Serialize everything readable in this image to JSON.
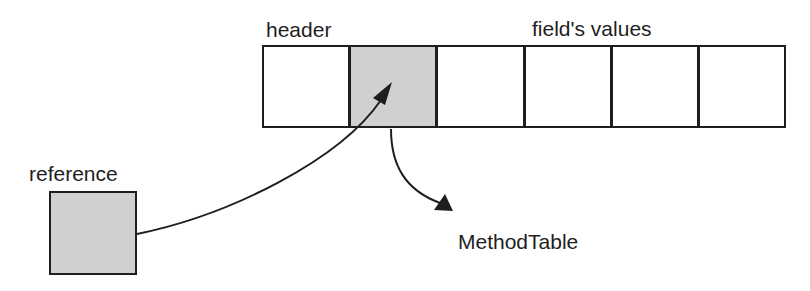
{
  "labels": {
    "header": "header",
    "fields": "field's values",
    "reference": "reference",
    "method_table": "MethodTable"
  },
  "object_cells": [
    {
      "role": "header",
      "shaded": false
    },
    {
      "role": "method-table-pointer",
      "shaded": true
    },
    {
      "role": "field",
      "shaded": false
    },
    {
      "role": "field",
      "shaded": false
    },
    {
      "role": "field",
      "shaded": false
    },
    {
      "role": "field",
      "shaded": false
    }
  ],
  "colors": {
    "stroke": "#1e1e1e",
    "shade": "#d0d0d0",
    "background": "#ffffff"
  }
}
